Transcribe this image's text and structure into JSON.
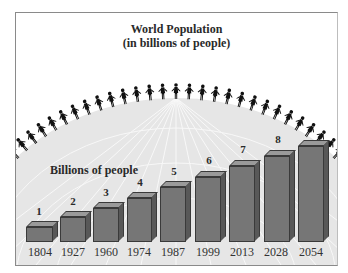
{
  "chart_data": {
    "type": "bar",
    "title": "World Population",
    "subtitle": "(in billions of people)",
    "xlabel": "",
    "ylabel": "Billions of people",
    "categories": [
      "1804",
      "1927",
      "1960",
      "1974",
      "1987",
      "1999",
      "2013",
      "2028",
      "2054"
    ],
    "values": [
      1,
      2,
      3,
      4,
      5,
      6,
      7,
      8,
      9
    ],
    "value_labels": [
      "1",
      "2",
      "3",
      "4",
      "5",
      "6",
      "7",
      "8",
      ""
    ],
    "ylim": [
      0,
      9
    ],
    "grid": false,
    "legend": null,
    "style": "3d-bar",
    "bar_color": "#767676"
  },
  "header": {
    "title": "World Population",
    "subtitle": "(in billions of people)"
  },
  "axis": {
    "ylabel": "Billions of people"
  },
  "bars": [
    {
      "year": "1804",
      "label": "1"
    },
    {
      "year": "1927",
      "label": "2"
    },
    {
      "year": "1960",
      "label": "3"
    },
    {
      "year": "1974",
      "label": "4"
    },
    {
      "year": "1987",
      "label": "5"
    },
    {
      "year": "1999",
      "label": "6"
    },
    {
      "year": "2013",
      "label": "7"
    },
    {
      "year": "2028",
      "label": "8"
    },
    {
      "year": "2054",
      "label": ""
    }
  ]
}
